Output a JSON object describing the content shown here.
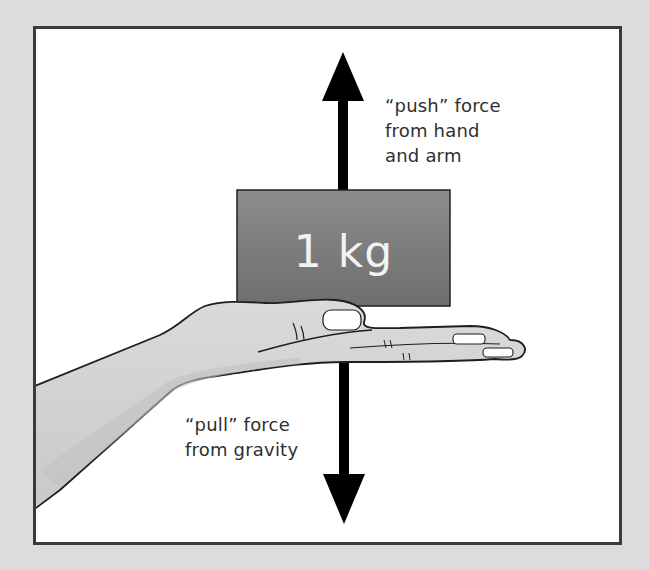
{
  "diagram": {
    "mass_label": "1 kg",
    "push_label": [
      "“push” force",
      "from hand",
      "and arm"
    ],
    "pull_label": [
      "“pull” force",
      "from gravity"
    ],
    "colors": {
      "background": "#dcdcdc",
      "frame_border": "#3a3a3a",
      "block": "#7a7a7a",
      "hand": "#d4d4d4",
      "arrow": "#000000",
      "text": "#2f2f2f"
    },
    "arrows": [
      {
        "name": "push-arrow",
        "direction": "up"
      },
      {
        "name": "pull-arrow",
        "direction": "down"
      }
    ]
  }
}
